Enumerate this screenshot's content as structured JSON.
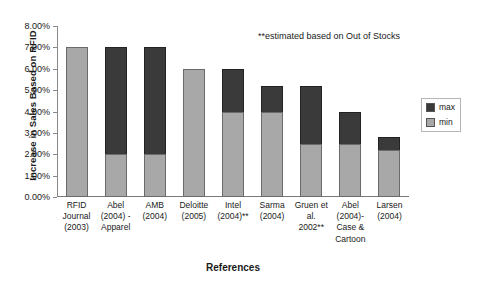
{
  "chart_data": {
    "type": "bar",
    "stacked": true,
    "title": "",
    "xlabel": "References",
    "ylabel": "Increase in Sales Based on RFID",
    "ylim": [
      0,
      8
    ],
    "ytick_labels": [
      "0.00%",
      "1.00%",
      "2.00%",
      "3.00%",
      "4.00%",
      "5.00%",
      "6.00%",
      "7.00%",
      "8.00%"
    ],
    "ytick_values": [
      0,
      1,
      2,
      3,
      4,
      5,
      6,
      7,
      8
    ],
    "grid": false,
    "legend_position": "right",
    "annotation": "**estimated based on Out of Stocks",
    "categories": [
      "RFID Journal (2003)",
      "Abel (2004) - Apparel",
      "AMB (2004)",
      "Deloitte (2005)",
      "Intel (2004)**",
      "Sarma (2004)",
      "Gruen et al. 2002**",
      "Abel (2004)- Case & Cartoon",
      "Larsen (2004)"
    ],
    "category_lines": [
      [
        "RFID",
        "Journal",
        "(2003)"
      ],
      [
        "Abel",
        "(2004) -",
        "Apparel"
      ],
      [
        "AMB",
        "(2004)"
      ],
      [
        "Deloitte",
        "(2005)"
      ],
      [
        "Intel",
        "(2004)**"
      ],
      [
        "Sarma",
        "(2004)"
      ],
      [
        "Gruen et",
        "al.",
        "2002**"
      ],
      [
        "Abel",
        "(2004)-",
        "Case &",
        "Cartoon"
      ],
      [
        "Larsen",
        "(2004)"
      ]
    ],
    "series": [
      {
        "name": "min",
        "color": "#a8a8a8",
        "values": [
          7.0,
          2.0,
          2.0,
          6.0,
          4.0,
          4.0,
          2.5,
          2.5,
          2.2
        ]
      },
      {
        "name": "max",
        "color": "#3a3a3a",
        "values": [
          0.0,
          5.0,
          5.0,
          0.0,
          2.0,
          1.2,
          2.7,
          1.5,
          0.6
        ]
      }
    ],
    "totals": [
      7.0,
      7.0,
      7.0,
      6.0,
      6.0,
      5.2,
      5.2,
      4.0,
      2.8
    ]
  },
  "legend": {
    "items": [
      {
        "label": "max",
        "color": "#3a3a3a"
      },
      {
        "label": "min",
        "color": "#a8a8a8"
      }
    ]
  }
}
